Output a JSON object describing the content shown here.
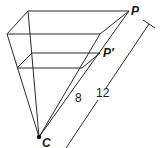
{
  "diagram": {
    "type": "perspective-projection-pyramid",
    "colors": {
      "stroke": "#2a2a2a",
      "text": "#1a1a1a",
      "background": "#ffffff"
    },
    "labels": {
      "point_far": "P",
      "point_near": "P′",
      "center": "C",
      "near_distance": "8",
      "far_distance": "12"
    },
    "points": {
      "C": [
        39,
        137
      ],
      "large_back_left": [
        28,
        11
      ],
      "large_back_right_P": [
        129,
        11
      ],
      "large_front_left": [
        7,
        34
      ],
      "large_front_right": [
        100,
        34
      ],
      "small_back_left": [
        32,
        53
      ],
      "small_back_right_Pprime": [
        100,
        53
      ],
      "small_front_left": [
        17,
        68
      ],
      "small_front_right": [
        82,
        68
      ]
    },
    "dimension_line": {
      "start": [
        66,
        148
      ],
      "end": [
        150,
        24
      ],
      "value": "12"
    }
  }
}
